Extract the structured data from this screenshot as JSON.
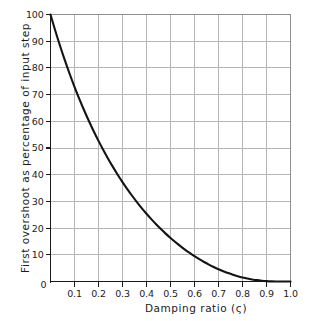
{
  "chart_data": {
    "type": "line",
    "title": "",
    "subtitle": "",
    "xlabel": "Damping ratio (ς)",
    "ylabel": "First overshoot as percentage of input step",
    "xlim": [
      0,
      1.0
    ],
    "ylim": [
      0,
      100
    ],
    "grid": true,
    "legend": null,
    "legend_position": "none",
    "x_tick_labels": [
      "0",
      "0.1",
      "0.2",
      "0.3",
      "0.4",
      "0.5",
      "0.6",
      "0.7",
      "0.8",
      "0.9",
      "1.0"
    ],
    "x_tick_values": [
      0,
      0.1,
      0.2,
      0.3,
      0.4,
      0.5,
      0.6,
      0.7,
      0.8,
      0.9,
      1.0
    ],
    "y_tick_labels": [
      "0",
      "10",
      "20",
      "30",
      "40",
      "50",
      "60",
      "70",
      "80",
      "90",
      "100"
    ],
    "y_tick_values": [
      0,
      10,
      20,
      30,
      40,
      50,
      60,
      70,
      80,
      90,
      100
    ],
    "series": [
      {
        "name": "First overshoot",
        "x": [
          0.0,
          0.02,
          0.04,
          0.06,
          0.08,
          0.1,
          0.12,
          0.14,
          0.16,
          0.18,
          0.2,
          0.22,
          0.24,
          0.26,
          0.28,
          0.3,
          0.32,
          0.34,
          0.36,
          0.38,
          0.4,
          0.42,
          0.44,
          0.46,
          0.48,
          0.5,
          0.52,
          0.54,
          0.56,
          0.58,
          0.6,
          0.62,
          0.64,
          0.66,
          0.68,
          0.7,
          0.72,
          0.74,
          0.76,
          0.78,
          0.8,
          0.82,
          0.84,
          0.86,
          0.88,
          0.9,
          0.92,
          0.94,
          0.96,
          0.98,
          1.0
        ],
        "values": [
          100.0,
          93.9,
          88.1,
          82.7,
          77.6,
          72.9,
          68.4,
          64.2,
          60.2,
          56.5,
          52.7,
          49.6,
          46.5,
          43.6,
          40.9,
          37.2,
          35.2,
          32.9,
          30.7,
          28.6,
          25.4,
          24.4,
          22.6,
          20.9,
          19.3,
          16.3,
          16.3,
          14.9,
          13.6,
          12.4,
          9.5,
          10.2,
          9.2,
          8.3,
          7.4,
          4.6,
          5.9,
          5.2,
          4.5,
          3.9,
          1.5,
          2.9,
          2.4,
          2.0,
          1.6,
          0.2,
          1.0,
          0.7,
          0.5,
          0.2,
          0.0
        ]
      }
    ],
    "annotations": []
  },
  "colors": {
    "curve": "#141414",
    "grid": "#adadad",
    "axis": "#1a1a1a",
    "background": "#ffffff",
    "text": "#1c1c1c"
  }
}
